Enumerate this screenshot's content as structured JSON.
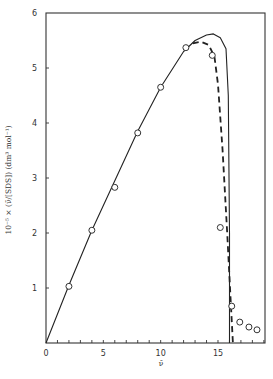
{
  "chart_data": {
    "type": "scatter",
    "title": "",
    "xlabel": "ν̄",
    "ylabel": "10⁻⁵ × (ν̄/[SDS]) (dm³ mol⁻¹)",
    "xlim": [
      0,
      19.1
    ],
    "ylim": [
      0,
      6
    ],
    "x_ticks": [
      0,
      5,
      10,
      15
    ],
    "x_tick_labels": [
      "0",
      "5",
      "10",
      "15"
    ],
    "y_ticks": [
      1,
      2,
      3,
      4,
      5,
      6
    ],
    "y_tick_labels": [
      "1",
      "2",
      "3",
      "4",
      "5",
      "6"
    ],
    "grid": false,
    "legend": null,
    "series": [
      {
        "name": "experimental points",
        "style": "open-circle",
        "x": [
          2.0,
          4.0,
          6.0,
          8.0,
          10.0,
          12.2,
          14.5,
          15.2,
          16.2,
          16.9,
          17.7,
          18.4
        ],
        "y": [
          1.03,
          2.05,
          2.83,
          3.82,
          4.65,
          5.37,
          5.23,
          2.1,
          0.67,
          0.38,
          0.29,
          0.24
        ]
      },
      {
        "name": "solid curve",
        "style": "solid-line",
        "x": [
          0,
          2,
          4,
          6,
          8,
          10,
          12,
          13,
          14,
          14.6,
          15.2,
          15.7,
          15.9,
          16.0,
          16.0
        ],
        "y": [
          0,
          1.05,
          2.05,
          2.95,
          3.85,
          4.65,
          5.3,
          5.5,
          5.6,
          5.62,
          5.55,
          5.35,
          4.5,
          2.0,
          0
        ]
      },
      {
        "name": "dashed curve",
        "style": "dashed-line",
        "x": [
          12.8,
          13.5,
          14.2,
          14.7,
          15.0,
          15.4,
          15.8,
          16.1,
          16.3
        ],
        "y": [
          5.45,
          5.48,
          5.42,
          5.2,
          4.7,
          3.5,
          2.0,
          0.8,
          0
        ]
      }
    ]
  }
}
